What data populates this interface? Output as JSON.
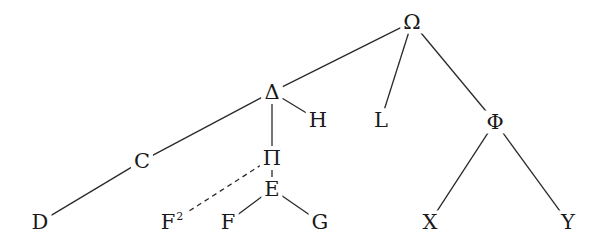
{
  "diagram": {
    "type": "tree",
    "nodes": [
      {
        "id": "omega",
        "label": "Ω",
        "x": 412,
        "y": 22
      },
      {
        "id": "delta",
        "label": "Δ",
        "x": 272,
        "y": 92
      },
      {
        "id": "L",
        "label": "L",
        "x": 381,
        "y": 120
      },
      {
        "id": "phi",
        "label": "Φ",
        "x": 495,
        "y": 122
      },
      {
        "id": "H",
        "label": "H",
        "x": 318,
        "y": 120
      },
      {
        "id": "pi",
        "label": "Π",
        "x": 272,
        "y": 158
      },
      {
        "id": "C",
        "label": "C",
        "x": 142,
        "y": 161
      },
      {
        "id": "E",
        "label": "E",
        "x": 272,
        "y": 189
      },
      {
        "id": "D",
        "label": "D",
        "x": 40,
        "y": 222
      },
      {
        "id": "F2",
        "label": "F",
        "sup": "2",
        "x": 172,
        "y": 222
      },
      {
        "id": "F",
        "label": "F",
        "x": 228,
        "y": 222
      },
      {
        "id": "G",
        "label": "G",
        "x": 320,
        "y": 222
      },
      {
        "id": "X",
        "label": "X",
        "x": 430,
        "y": 222
      },
      {
        "id": "Y",
        "label": "Y",
        "x": 568,
        "y": 222
      }
    ],
    "edges": [
      {
        "from": "omega",
        "to": "delta",
        "style": "solid"
      },
      {
        "from": "omega",
        "to": "L",
        "style": "solid"
      },
      {
        "from": "omega",
        "to": "phi",
        "style": "solid"
      },
      {
        "from": "delta",
        "to": "C",
        "style": "solid"
      },
      {
        "from": "delta",
        "to": "pi",
        "style": "solid"
      },
      {
        "from": "delta",
        "to": "H",
        "style": "solid"
      },
      {
        "from": "C",
        "to": "D",
        "style": "solid"
      },
      {
        "from": "pi",
        "to": "F2",
        "style": "dashed"
      },
      {
        "from": "pi",
        "to": "E",
        "style": "solid"
      },
      {
        "from": "E",
        "to": "F",
        "style": "solid"
      },
      {
        "from": "E",
        "to": "G",
        "style": "solid"
      },
      {
        "from": "phi",
        "to": "X",
        "style": "solid"
      },
      {
        "from": "phi",
        "to": "Y",
        "style": "solid"
      }
    ]
  }
}
